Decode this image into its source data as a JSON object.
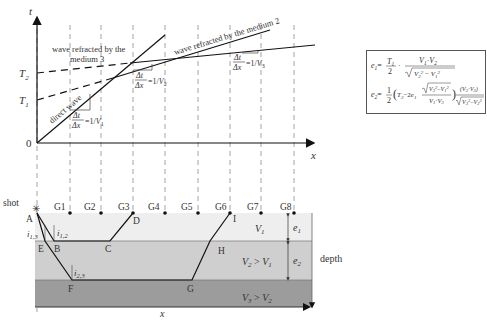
{
  "figure": {
    "top_chart": {
      "y_axis_label": "t",
      "x_axis_label": "x",
      "origin_label": "0",
      "y_ticks": [
        "T2",
        "T1"
      ],
      "curves": [
        {
          "name": "direct wave",
          "label": "direct wave",
          "slope_label": "Δt/Δx = 1/V1"
        },
        {
          "name": "refracted medium 2",
          "label": "wave refracted by the medium 2",
          "slope_label": "Δt/Δx = 1/V2"
        },
        {
          "name": "refracted medium 3",
          "label": "wave refracted by the medium 3",
          "slope_label": "Δt/Δx = 1/V3"
        }
      ]
    },
    "formulas": {
      "e1": "e1 = (T1/2) · (V1·V2) / √(V2² − V1²)",
      "e2": "e2 = ½ (T2 − 2e1 · √(V3² − V1²)/(V1·V3)) · (V2·V3)/√(V3² − V2²)"
    },
    "bottom_section": {
      "shot_label": "shot",
      "geophones": [
        "G1",
        "G2",
        "G3",
        "G4",
        "G5",
        "G6",
        "G7",
        "G8"
      ],
      "points": [
        "A",
        "B",
        "C",
        "D",
        "E",
        "F",
        "G",
        "H",
        "I"
      ],
      "angles": [
        "i1,2",
        "i1,3",
        "i2,3"
      ],
      "layers": [
        {
          "label": "V1",
          "thickness": "e1",
          "color": "#eeeeee"
        },
        {
          "label": "V2 > V1",
          "thickness": "e2",
          "color": "#cfcfcf"
        },
        {
          "label": "V3 > V2",
          "thickness": "",
          "color": "#9c9c9c"
        }
      ],
      "depth_label": "depth",
      "x_label": "x"
    }
  }
}
